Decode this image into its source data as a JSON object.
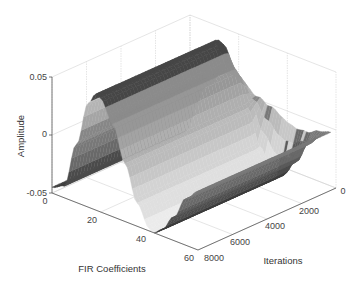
{
  "chart_data": {
    "type": "surface",
    "title": "",
    "xlabel": "FIR Coefficients",
    "ylabel": "Iterations",
    "zlabel": "Amplitude",
    "xlim": [
      0,
      60
    ],
    "ylim": [
      0,
      8000
    ],
    "zlim": [
      -0.05,
      0.05
    ],
    "x_ticks": [
      "0",
      "20",
      "40",
      "60"
    ],
    "y_ticks": [
      "0",
      "2000",
      "4000",
      "6000",
      "8000"
    ],
    "z_ticks": [
      "-0.05",
      "0",
      "0.05"
    ],
    "grid": true,
    "colormap": "gray",
    "profile_at_convergence": {
      "x": [
        0,
        5,
        10,
        15,
        18,
        20,
        25,
        30,
        35,
        40,
        42,
        45,
        50,
        55,
        60
      ],
      "z": [
        -0.045,
        -0.04,
        0.0,
        0.04,
        0.05,
        0.048,
        0.03,
        0.0,
        -0.03,
        -0.048,
        -0.05,
        -0.045,
        -0.03,
        -0.01,
        0.0
      ]
    }
  }
}
